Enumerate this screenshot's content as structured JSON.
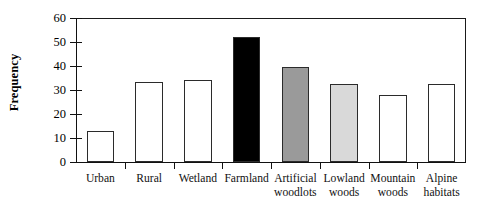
{
  "chart_data": {
    "type": "bar",
    "title": "",
    "xlabel": "",
    "ylabel": "Frequency",
    "ylim": [
      0,
      60
    ],
    "ytick_step": 10,
    "yticks": [
      0,
      10,
      20,
      30,
      40,
      50,
      60
    ],
    "grid": false,
    "legend": null,
    "categories": [
      "Urban",
      "Rural",
      "Wetland",
      "Farmland",
      "Artificial woodlots",
      "Lowland woods",
      "Mountain woods",
      "Alpine habitats"
    ],
    "category_lines": [
      [
        "Urban"
      ],
      [
        "Rural"
      ],
      [
        "Wetland"
      ],
      [
        "Farmland"
      ],
      [
        "Artificial",
        "woodlots"
      ],
      [
        "Lowland",
        "woods"
      ],
      [
        "Mountain",
        "woods"
      ],
      [
        "Alpine",
        "habitats"
      ]
    ],
    "values": [
      13,
      33.5,
      34,
      52,
      39.5,
      32.5,
      28,
      32.5
    ],
    "bar_colors": [
      "#ffffff",
      "#ffffff",
      "#ffffff",
      "#000000",
      "#9a9a9a",
      "#d9d9d9",
      "#ffffff",
      "#ffffff"
    ],
    "bar_edge_color": "#2b2b2b",
    "axis_color": "#111111"
  }
}
